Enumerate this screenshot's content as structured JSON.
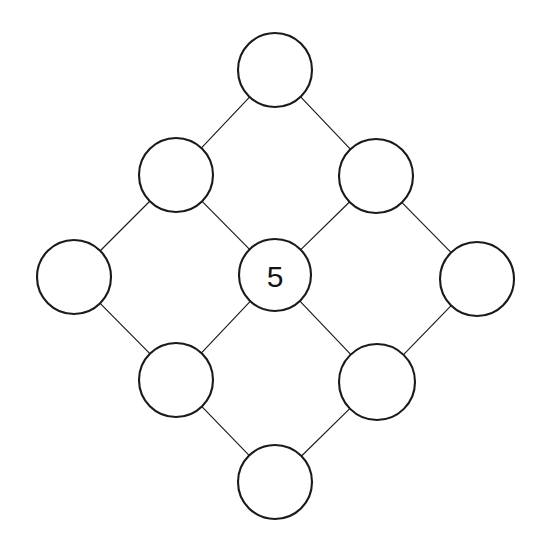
{
  "canvas": {
    "width": 545,
    "height": 551,
    "background_color": "#ffffff"
  },
  "style": {
    "node_stroke_color": "#1a1a1a",
    "node_fill_color": "#ffffff",
    "node_stroke_width": 2.1,
    "edge_stroke_color": "#1b1b1b",
    "edge_stroke_width": 1.15,
    "label_color": "#141414",
    "label_font_size": 30
  },
  "diagram": {
    "type": "node-link-graph",
    "shape": "diamond-lattice",
    "node_count": 9,
    "edge_count": 12,
    "filled_node_count": 1,
    "empty_node_count": 8
  },
  "nodes": [
    {
      "id": "top",
      "label": "",
      "cx": 275,
      "cy": 70,
      "r": 37,
      "row": 0,
      "col": 1
    },
    {
      "id": "upper-left",
      "label": "",
      "cx": 176,
      "cy": 175,
      "r": 37,
      "row": 1,
      "col": 0
    },
    {
      "id": "upper-right",
      "label": "",
      "cx": 376,
      "cy": 176,
      "r": 37,
      "row": 1,
      "col": 2
    },
    {
      "id": "left",
      "label": "",
      "cx": 74,
      "cy": 277,
      "r": 37,
      "row": 2,
      "col": 0
    },
    {
      "id": "center",
      "label": "5",
      "cx": 275,
      "cy": 275,
      "r": 36,
      "row": 2,
      "col": 1
    },
    {
      "id": "right",
      "label": "",
      "cx": 477,
      "cy": 279,
      "r": 37,
      "row": 2,
      "col": 2
    },
    {
      "id": "lower-left",
      "label": "",
      "cx": 176,
      "cy": 380,
      "r": 37,
      "row": 3,
      "col": 0
    },
    {
      "id": "lower-right",
      "label": "",
      "cx": 377,
      "cy": 382,
      "r": 38,
      "row": 3,
      "col": 2
    },
    {
      "id": "bottom",
      "label": "",
      "cx": 275,
      "cy": 482,
      "r": 37,
      "row": 4,
      "col": 1
    }
  ],
  "edges": [
    {
      "from": "top",
      "to": "upper-left"
    },
    {
      "from": "top",
      "to": "upper-right"
    },
    {
      "from": "upper-left",
      "to": "left"
    },
    {
      "from": "upper-left",
      "to": "center"
    },
    {
      "from": "upper-right",
      "to": "center"
    },
    {
      "from": "upper-right",
      "to": "right"
    },
    {
      "from": "left",
      "to": "lower-left"
    },
    {
      "from": "center",
      "to": "lower-left"
    },
    {
      "from": "center",
      "to": "lower-right"
    },
    {
      "from": "right",
      "to": "lower-right"
    },
    {
      "from": "lower-left",
      "to": "bottom"
    },
    {
      "from": "lower-right",
      "to": "bottom"
    }
  ]
}
